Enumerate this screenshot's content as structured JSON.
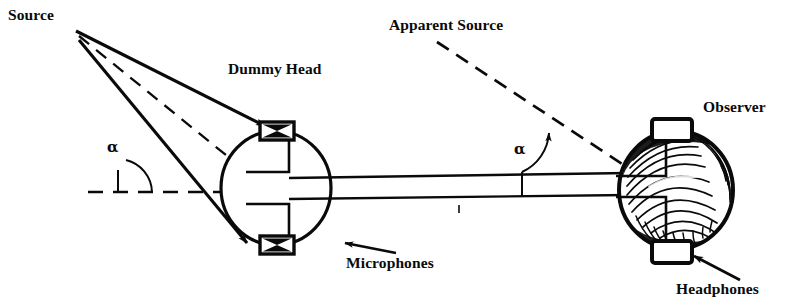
{
  "figure": {
    "background_color": "#ffffff",
    "ink_color": "#0a0a0a"
  },
  "labels": {
    "source": "Source",
    "dummy_head": "Dummy Head",
    "apparent_source": "Apparent Source",
    "observer": "Observer",
    "microphones": "Microphones",
    "headphones": "Headphones",
    "alpha_left": "α",
    "alpha_right": "α"
  },
  "diagram_data": {
    "type": "schematic",
    "scene": "Sound source at angle alpha relative to a dummy head fitted with microphones; signal is carried by cable to headphones worn by an observer, reproducing an apparent source at the same angle alpha.",
    "source_point": {
      "x": 76,
      "y": 31
    },
    "rays": [
      {
        "name": "upper-ray",
        "style": "solid",
        "from": [
          76,
          31
        ],
        "to": [
          268,
          128
        ],
        "arrowhead": true
      },
      {
        "name": "center-ray",
        "style": "dashed",
        "from": [
          76,
          31
        ],
        "to": [
          262,
          182
        ],
        "arrowhead": false
      },
      {
        "name": "lower-ray",
        "style": "solid",
        "from": [
          76,
          31
        ],
        "to": [
          250,
          245
        ],
        "arrowhead": true
      }
    ],
    "reference_line": {
      "name": "horizontal-axis-left",
      "style": "dashed",
      "from": [
        88,
        192
      ],
      "to": [
        243,
        192
      ]
    },
    "angle_left": {
      "label": "α",
      "vertex": [
        118,
        192
      ],
      "from_deg": 0,
      "to_deg": 60
    },
    "angle_right": {
      "label": "α",
      "vertex": [
        522,
        189
      ],
      "from_deg": 0,
      "to_deg": 58
    },
    "dummy_head": {
      "shape": "ellipse",
      "center": [
        276,
        188
      ],
      "rx": 56,
      "ry": 58,
      "microphones": [
        {
          "position": "top",
          "center": [
            277,
            131
          ],
          "width": 34,
          "height": 18,
          "symbol": "bowtie-x"
        },
        {
          "position": "bottom",
          "center": [
            277,
            245
          ],
          "width": 34,
          "height": 18,
          "symbol": "bowtie-x"
        }
      ]
    },
    "cable": {
      "name": "connecting-cable",
      "lines": [
        {
          "from": [
            290,
            179
          ],
          "to": [
            625,
            174
          ]
        },
        {
          "from": [
            290,
            200
          ],
          "to": [
            625,
            196
          ]
        }
      ],
      "tick_marks": [
        {
          "x": 522,
          "y_top": 174,
          "y_bottom": 196
        },
        {
          "x": 459,
          "y_top": 205,
          "y_bottom": 212
        }
      ]
    },
    "apparent_source_line": {
      "name": "apparent-source-dashed-line",
      "style": "dashed",
      "from": [
        437,
        42
      ],
      "to": [
        648,
        182
      ],
      "arrowhead_at": [
        544,
        116
      ]
    },
    "observer_head": {
      "shape": "hair-textured-oval",
      "center": [
        676,
        190
      ],
      "rx": 58,
      "ry": 60,
      "headband_arc": true,
      "earcups": [
        {
          "position": "top",
          "center": [
            672,
            130
          ],
          "width": 40,
          "height": 22
        },
        {
          "position": "bottom",
          "center": [
            672,
            252
          ],
          "width": 40,
          "height": 22
        }
      ]
    },
    "callout_arrows": [
      {
        "name": "microphones-callout",
        "from": [
          394,
          252
        ],
        "to": [
          343,
          244
        ]
      },
      {
        "name": "headphones-callout",
        "from": [
          737,
          277
        ],
        "to": [
          694,
          255
        ]
      }
    ]
  }
}
